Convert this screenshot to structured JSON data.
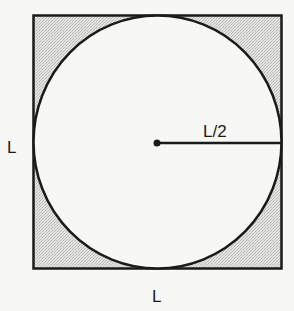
{
  "diagram": {
    "labels": {
      "left_side": "L",
      "bottom_side": "L",
      "radius": "L/2"
    },
    "colors": {
      "background": "#f7f7f5",
      "shaded_region": "#d9d9d6",
      "circle_fill": "#f7f7f5",
      "stroke": "#1a1a1a"
    }
  }
}
